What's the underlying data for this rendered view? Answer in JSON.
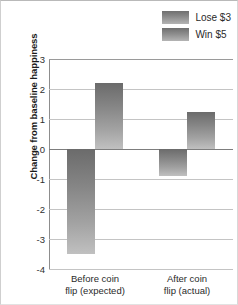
{
  "chart_data": {
    "type": "bar",
    "title": "",
    "xlabel": "",
    "ylabel": "Change from baseline happiness",
    "categories": [
      "Before coin\nflip (expected)",
      "After coin\nflip (actual)"
    ],
    "category_lines": [
      [
        "Before coin",
        "flip (expected)"
      ],
      [
        "After coin",
        "flip (actual)"
      ]
    ],
    "series": [
      {
        "name": "Lose $3",
        "values": [
          -3.5,
          -0.9
        ]
      },
      {
        "name": "Win $5",
        "values": [
          2.2,
          1.25
        ]
      }
    ],
    "ylim": [
      -4,
      3
    ],
    "ytick_labels": [
      "3",
      "2",
      "1",
      "0",
      "-1",
      "-2",
      "-3",
      "-4"
    ],
    "ytick_values": [
      3,
      2,
      1,
      0,
      -1,
      -2,
      -3,
      -4
    ],
    "grid": true,
    "legend_position": "top-right",
    "bar_color_top": "#6b6b6b",
    "bar_color_bottom": "#c0c0c0",
    "gridline_color": "#c4c4c4",
    "zero_line_color": "#7d7d7d",
    "axis_color": "#8d8d8d"
  },
  "legend": {
    "items": [
      {
        "label": "Lose $3"
      },
      {
        "label": "Win $5"
      }
    ]
  }
}
